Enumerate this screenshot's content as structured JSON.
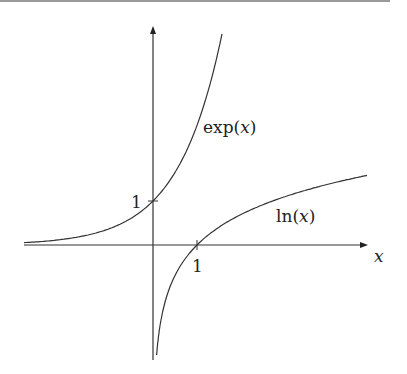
{
  "figure": {
    "curves": [
      {
        "name": "exp",
        "label": "exp(x)",
        "label_fn": "exp(",
        "label_var": "x",
        "label_close": ")"
      },
      {
        "name": "ln",
        "label": "ln(x)",
        "label_fn": "ln(",
        "label_var": "x",
        "label_close": ")"
      }
    ],
    "x_axis_label": "x",
    "y_tick_label": "1",
    "x_tick_label": "1",
    "colors": {
      "line": "#333333",
      "background": "#ffffff"
    }
  }
}
